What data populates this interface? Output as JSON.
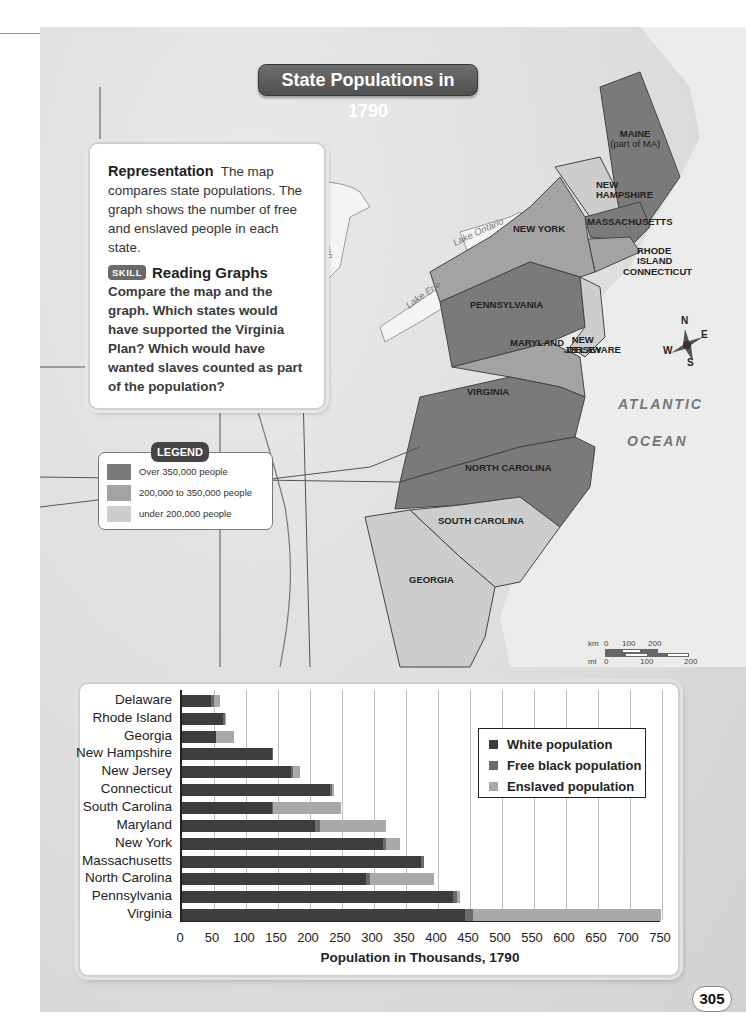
{
  "map": {
    "title": "State Populations in 1790",
    "info_box": {
      "lead": "Representation",
      "body": "The map compares state populations. The graph shows the number of free and enslaved people in each state.",
      "skill_badge": "SKILL",
      "skill_title": "Reading Graphs",
      "question": "Compare the map and the graph. Which states would have supported the Virginia Plan? Which would have wanted slaves counted as part of the population?"
    },
    "legend": {
      "title": "LEGEND",
      "items": [
        {
          "label": "Over 350,000 people",
          "color": "#7a7a7a"
        },
        {
          "label": "200,000 to 350,000 people",
          "color": "#a3a3a3"
        },
        {
          "label": "under 200,000 people",
          "color": "#cdcdcd"
        }
      ]
    },
    "state_labels": {
      "maine": "MAINE",
      "maine_note": "(part of MA)",
      "new_hampshire_1": "NEW",
      "new_hampshire_2": "HAMPSHIRE",
      "massachusetts": "MASSACHUSETTS",
      "new_york": "NEW YORK",
      "rhode_island_1": "RHODE",
      "rhode_island_2": "ISLAND",
      "connecticut": "CONNECTICUT",
      "pennsylvania": "PENNSYLVANIA",
      "new_jersey_1": "NEW",
      "new_jersey_2": "JERSEY",
      "maryland": "MARYLAND",
      "delaware": "DELAWARE",
      "virginia": "VIRGINIA",
      "north_carolina": "NORTH CAROLINA",
      "south_carolina": "SOUTH CAROLINA",
      "georgia": "GEORGIA"
    },
    "water_labels": {
      "ocean_1": "ATLANTIC",
      "ocean_2": "OCEAN",
      "lake_huron": "L. Huron",
      "lake_ontario": "Lake Ontario",
      "lake_erie": "Lake Erie"
    },
    "compass": {
      "n": "N",
      "e": "E",
      "s": "S",
      "w": "W"
    },
    "scale": {
      "km_label": "km",
      "km_0": "0",
      "km_100": "100",
      "km_200": "200",
      "mi_label": "mi",
      "mi_0": "0",
      "mi_100": "100",
      "mi_200": "200"
    }
  },
  "chart_data": {
    "type": "bar",
    "orientation": "horizontal",
    "stacked": true,
    "title": "",
    "xlabel": "Population in Thousands, 1790",
    "ylabel": "",
    "xlim": [
      0,
      750
    ],
    "x_ticks": [
      "0",
      "50",
      "100",
      "150",
      "200",
      "250",
      "300",
      "350",
      "400",
      "450",
      "500",
      "550",
      "600",
      "650",
      "700",
      "750"
    ],
    "grid": "vertical",
    "legend_position": "upper right (inside plot)",
    "categories": [
      "Delaware",
      "Rhode Island",
      "Georgia",
      "New Hampshire",
      "New Jersey",
      "Connecticut",
      "South Carolina",
      "Maryland",
      "New York",
      "Massachusetts",
      "North Carolina",
      "Pennsylvania",
      "Virginia"
    ],
    "series": [
      {
        "name": "White population",
        "color": "#3d3d3d",
        "values": [
          46,
          64,
          53,
          141,
          170,
          232,
          140,
          208,
          314,
          373,
          288,
          424,
          442
        ]
      },
      {
        "name": "Free black population",
        "color": "#6b6b6b",
        "values": [
          4,
          3,
          0,
          1,
          3,
          3,
          2,
          8,
          5,
          5,
          5,
          6,
          13
        ]
      },
      {
        "name": "Enslaved population",
        "color": "#a9a9a9",
        "values": [
          9,
          1,
          29,
          0,
          11,
          3,
          107,
          103,
          21,
          0,
          101,
          4,
          293
        ]
      }
    ]
  },
  "page": {
    "number": "305"
  }
}
